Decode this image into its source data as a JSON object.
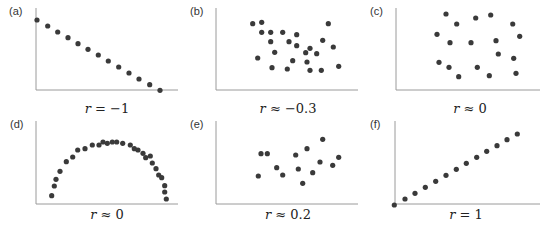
{
  "style": {
    "point_color": "#3a3a3a",
    "axis_color": "#9a9a9a",
    "point_radius": 2.6
  },
  "chart_data": [
    {
      "type": "scatter",
      "panel": "(a)",
      "caption_var": "r",
      "caption_rel": "= −1",
      "title": "r = −1",
      "xlabel": "",
      "ylabel": "",
      "grid": false,
      "origin": [
        0,
        0
      ],
      "axis": {
        "x0": 36,
        "y_top": 8,
        "y_bottom": 90,
        "x_right": 178
      },
      "caption_pos": [
        107,
        109
      ],
      "tag_pos": [
        9,
        11
      ],
      "points": [
        [
          37,
          20
        ],
        [
          47.7,
          26
        ],
        [
          57.7,
          32
        ],
        [
          68,
          37.7
        ],
        [
          78,
          43.7
        ],
        [
          88,
          49.3
        ],
        [
          98.3,
          55
        ],
        [
          108.3,
          61
        ],
        [
          118.7,
          67
        ],
        [
          129,
          73
        ],
        [
          139,
          79
        ],
        [
          149.7,
          84.7
        ],
        [
          160,
          90.3
        ]
      ]
    },
    {
      "type": "scatter",
      "panel": "(b)",
      "caption_var": "r",
      "caption_rel": "≈ −0.3",
      "title": "r ≈ −0.3",
      "xlabel": "",
      "ylabel": "",
      "grid": false,
      "origin": [
        180,
        0
      ],
      "axis": {
        "x0": 36,
        "y_top": 8,
        "y_bottom": 90,
        "x_right": 178
      },
      "caption_pos": [
        108,
        109
      ],
      "tag_pos": [
        10,
        11
      ],
      "points": [
        [
          72.7,
          23.7
        ],
        [
          81.7,
          22.3
        ],
        [
          81.7,
          32.3
        ],
        [
          90.7,
          32.3
        ],
        [
          102.7,
          32.3
        ],
        [
          116.7,
          34.7
        ],
        [
          90.7,
          41.7
        ],
        [
          109,
          41.7
        ],
        [
          116.7,
          45.7
        ],
        [
          142.7,
          40.3
        ],
        [
          153.3,
          47
        ],
        [
          148.3,
          23.7
        ],
        [
          130,
          48.3
        ],
        [
          125.7,
          52.7
        ],
        [
          136.7,
          53.7
        ],
        [
          94.7,
          52.3
        ],
        [
          77.7,
          58
        ],
        [
          112.7,
          60.7
        ],
        [
          127,
          62
        ],
        [
          92,
          67.7
        ],
        [
          107.3,
          69
        ],
        [
          130,
          70.3
        ],
        [
          141.3,
          70.3
        ],
        [
          158.7,
          66.3
        ]
      ]
    },
    {
      "type": "scatter",
      "panel": "(c)",
      "caption_var": "r",
      "caption_rel": "≈ 0",
      "title": "r ≈ 0",
      "xlabel": "",
      "ylabel": "",
      "grid": false,
      "origin": [
        360,
        0
      ],
      "axis": {
        "x0": 36,
        "y_top": 8,
        "y_bottom": 90,
        "x_right": 180
      },
      "caption_pos": [
        110,
        109
      ],
      "tag_pos": [
        10,
        11
      ],
      "points": [
        [
          86,
          14
        ],
        [
          96.7,
          24
        ],
        [
          115.7,
          18
        ],
        [
          130.7,
          15
        ],
        [
          152.7,
          24
        ],
        [
          77,
          34.3
        ],
        [
          159.7,
          36.3
        ],
        [
          90,
          42.7
        ],
        [
          111,
          42.7
        ],
        [
          136,
          40.7
        ],
        [
          138.3,
          54
        ],
        [
          153.7,
          58.3
        ],
        [
          79,
          62.3
        ],
        [
          89,
          67.3
        ],
        [
          117.3,
          67.3
        ],
        [
          98.7,
          76.7
        ],
        [
          129.3,
          75.7
        ],
        [
          156,
          73.3
        ]
      ]
    },
    {
      "type": "scatter",
      "panel": "(d)",
      "caption_var": "r",
      "caption_rel": "≈ 0",
      "title": "r ≈ 0",
      "xlabel": "",
      "ylabel": "",
      "grid": false,
      "origin": [
        0,
        113
      ],
      "axis": {
        "x0": 36,
        "y_top": 8,
        "y_bottom": 91,
        "x_right": 178
      },
      "caption_pos": [
        107,
        101.5
      ],
      "tag_pos": [
        10,
        11
      ],
      "points": [
        [
          51.7,
          82.7
        ],
        [
          54.3,
          73
        ],
        [
          56,
          66.3
        ],
        [
          60,
          58.3
        ],
        [
          66.3,
          48.7
        ],
        [
          72.7,
          44
        ],
        [
          77.7,
          37
        ],
        [
          85,
          35.7
        ],
        [
          92.3,
          32
        ],
        [
          99,
          32
        ],
        [
          103,
          29
        ],
        [
          107.3,
          30.3
        ],
        [
          112.3,
          29
        ],
        [
          116.7,
          29
        ],
        [
          122.7,
          30.3
        ],
        [
          130.3,
          32
        ],
        [
          134.3,
          35.7
        ],
        [
          138,
          37
        ],
        [
          143,
          40.3
        ],
        [
          145.7,
          44.7
        ],
        [
          150.3,
          43
        ],
        [
          152.3,
          50
        ],
        [
          156,
          55.7
        ],
        [
          158.7,
          62
        ],
        [
          161.7,
          64.7
        ],
        [
          164.7,
          72.7
        ],
        [
          164.7,
          79
        ],
        [
          166.3,
          86
        ]
      ]
    },
    {
      "type": "scatter",
      "panel": "(e)",
      "caption_var": "r",
      "caption_rel": "≈ 0.2",
      "title": "r ≈ 0.2",
      "xlabel": "",
      "ylabel": "",
      "grid": false,
      "origin": [
        180,
        113
      ],
      "axis": {
        "x0": 36,
        "y_top": 8,
        "y_bottom": 91,
        "x_right": 178
      },
      "caption_pos": [
        108,
        101.5
      ],
      "tag_pos": [
        10,
        11
      ],
      "points": [
        [
          81,
          40.7
        ],
        [
          87.3,
          40.7
        ],
        [
          78.3,
          63
        ],
        [
          96.7,
          54.7
        ],
        [
          102.7,
          62
        ],
        [
          115.7,
          42
        ],
        [
          127,
          35.7
        ],
        [
          142.7,
          26.3
        ],
        [
          118.3,
          56
        ],
        [
          122.7,
          70.3
        ],
        [
          132.7,
          59.7
        ],
        [
          140,
          49
        ],
        [
          152.7,
          52.3
        ],
        [
          158.7,
          44.3
        ]
      ]
    },
    {
      "type": "scatter",
      "panel": "(f)",
      "caption_var": "r",
      "caption_rel": "= 1",
      "title": "r = 1",
      "xlabel": "",
      "ylabel": "",
      "grid": false,
      "origin": [
        360,
        113
      ],
      "axis": {
        "x0": 35,
        "y_top": 8,
        "y_bottom": 91,
        "x_right": 180
      },
      "caption_pos": [
        106,
        101.5
      ],
      "tag_pos": [
        10,
        11
      ],
      "points": [
        [
          34.3,
          92
        ],
        [
          45,
          86
        ],
        [
          55,
          80.3
        ],
        [
          65.3,
          74.3
        ],
        [
          75.7,
          68.3
        ],
        [
          86,
          62.3
        ],
        [
          96.3,
          56.3
        ],
        [
          106.3,
          50.3
        ],
        [
          116.7,
          44.3
        ],
        [
          126.7,
          38.3
        ],
        [
          137,
          32.7
        ],
        [
          147,
          26.7
        ],
        [
          157.3,
          21
        ]
      ]
    }
  ]
}
